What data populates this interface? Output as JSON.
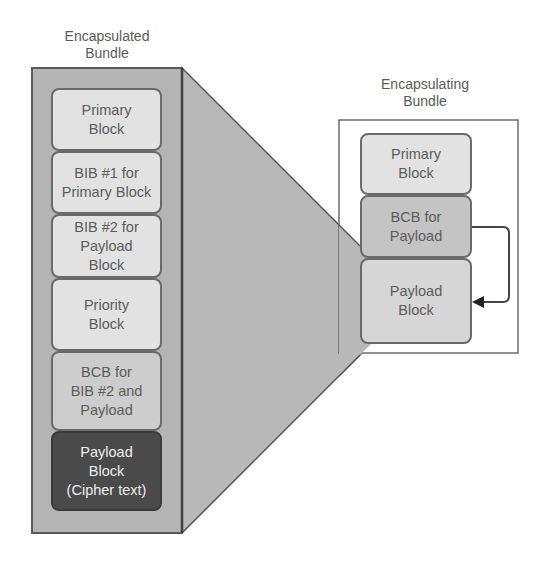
{
  "encapsulated": {
    "title": "Encapsulated\nBundle",
    "blocks": [
      {
        "label": "Primary\nBlock"
      },
      {
        "label": "BIB #1 for\nPrimary Block"
      },
      {
        "label": "BIB #2 for\nPayload\nBlock"
      },
      {
        "label": "Priority\nBlock"
      },
      {
        "label": "BCB for\nBIB #2 and\nPayload"
      },
      {
        "label": "Payload\nBlock\n(Cipher text)"
      }
    ]
  },
  "encapsulating": {
    "title": "Encapsulating\nBundle",
    "blocks": [
      {
        "label": "Primary\nBlock"
      },
      {
        "label": "BCB for\nPayload"
      },
      {
        "label": "Payload\nBlock"
      }
    ]
  },
  "colors": {
    "outer_bundle_fill": "#b4b4b4",
    "light_block": "#e2e2e2",
    "mid_block": "#cdcdcd",
    "dark_block": "#4a4a4a",
    "border": "#6a6a6a"
  }
}
